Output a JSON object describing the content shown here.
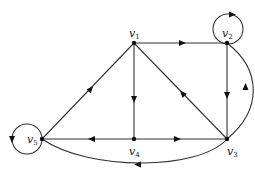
{
  "diagram": {
    "type": "directed-graph",
    "nodes": [
      {
        "id": "v1",
        "label": "v",
        "sub": "1",
        "x": 134,
        "y": 43
      },
      {
        "id": "v2",
        "label": "v",
        "sub": "2",
        "x": 227,
        "y": 43
      },
      {
        "id": "v3",
        "label": "v",
        "sub": "3",
        "x": 227,
        "y": 139
      },
      {
        "id": "v4",
        "label": "v",
        "sub": "4",
        "x": 134,
        "y": 139
      },
      {
        "id": "v5",
        "label": "v",
        "sub": "5",
        "x": 42,
        "y": 139
      }
    ],
    "edges": [
      {
        "from": "v1",
        "to": "v2",
        "shape": "straight"
      },
      {
        "from": "v2",
        "to": "v2",
        "shape": "loop"
      },
      {
        "from": "v1",
        "to": "v4",
        "shape": "straight"
      },
      {
        "from": "v3",
        "to": "v1",
        "shape": "straight"
      },
      {
        "from": "v5",
        "to": "v1",
        "shape": "straight"
      },
      {
        "from": "v2",
        "to": "v3",
        "shape": "straight"
      },
      {
        "from": "v3",
        "to": "v2",
        "shape": "curved"
      },
      {
        "from": "v4",
        "to": "v5",
        "shape": "straight"
      },
      {
        "from": "v4",
        "to": "v3",
        "shape": "straight"
      },
      {
        "from": "v3",
        "to": "v5",
        "shape": "curved"
      },
      {
        "from": "v5",
        "to": "v5",
        "shape": "loop"
      }
    ],
    "colors": {
      "line": "#333333",
      "node": "#111111",
      "background": "#ffffff"
    }
  }
}
